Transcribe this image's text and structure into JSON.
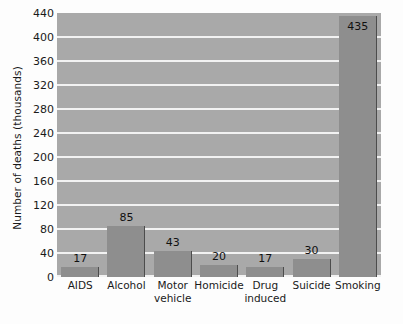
{
  "chart_data": {
    "type": "bar",
    "title": "",
    "xlabel": "",
    "ylabel": "Number of deaths (thousands)",
    "categories": [
      "AIDS",
      "Alcohol",
      "Motor vehicle",
      "Homicide",
      "Drug induced",
      "Suicide",
      "Smoking"
    ],
    "category_lines": [
      [
        "AIDS",
        ""
      ],
      [
        "Alcohol",
        ""
      ],
      [
        "Motor",
        "vehicle"
      ],
      [
        "Homicide",
        ""
      ],
      [
        "Drug",
        "induced"
      ],
      [
        "Suicide",
        ""
      ],
      [
        "Smoking",
        ""
      ]
    ],
    "values": [
      17,
      85,
      43,
      20,
      17,
      30,
      435
    ],
    "value_labels": [
      "17",
      "85",
      "43",
      "20",
      "17",
      "30",
      "435"
    ],
    "ylim": [
      0,
      440
    ],
    "ytick_values": [
      0,
      40,
      80,
      120,
      160,
      200,
      240,
      280,
      320,
      360,
      400,
      440
    ],
    "ytick_labels": [
      "0",
      "40",
      "80",
      "120",
      "160",
      "200",
      "240",
      "280",
      "320",
      "360",
      "400",
      "440"
    ],
    "grid": true,
    "grid_axis": "y",
    "legend": "none",
    "colors": {
      "plot_background": "#a9a9a9",
      "bar_fill": "#8e8e8e",
      "bar_edge": "#4c4c4c",
      "gridline": "#f2f2f2",
      "text": "#1a1a1a",
      "page_background": "#fdfdfd"
    }
  }
}
